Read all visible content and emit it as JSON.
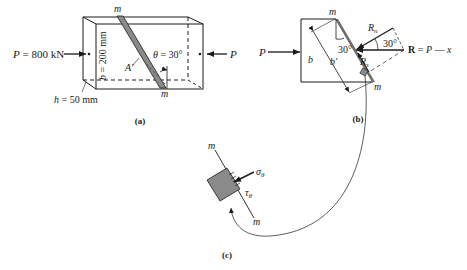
{
  "panel_a": {
    "caption": "(a)",
    "load_left": "P = 800 kN",
    "load_right": "P",
    "height_label": "b = 200 mm",
    "width_label": "h = 50 mm",
    "angle_label": "θ = 30°",
    "area_label": "A′",
    "plane_top": "m",
    "plane_bottom": "m"
  },
  "panel_b": {
    "caption": "(b)",
    "load_left": "P",
    "b_label": "b",
    "b_prime_label": "b′",
    "angle_inner": "30°",
    "angle_outer": "30°",
    "rn_label": "Rn",
    "rs_label": "Rs",
    "resultant_label": "R = P — x",
    "plane_top": "m",
    "plane_bottom": "m"
  },
  "panel_c": {
    "caption": "(c)",
    "sigma_label": "σθ",
    "tau_label": "τθ",
    "plane_top": "m",
    "plane_bottom": "m"
  },
  "colors": {
    "line": "#1a1a1a",
    "shade": "#8a8a8a",
    "dark_shade": "#6e6e6e"
  }
}
